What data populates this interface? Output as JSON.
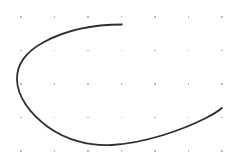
{
  "canvas": {
    "width": 239,
    "height": 168,
    "background_color": "#ffffff",
    "title": "C-Curve Sketch"
  },
  "grid": {
    "name": "dot-grid",
    "visible": true,
    "columns": 7,
    "rows": 5,
    "origin_x": 21,
    "origin_y": 17,
    "spacing_x": 33.5,
    "spacing_y": 33.5,
    "dot_color": "#b9b9b9",
    "dot_size": 1.2,
    "dot_count": 35,
    "dots": [
      {
        "x": 21,
        "y": 17
      },
      {
        "x": 54.5,
        "y": 17
      },
      {
        "x": 88,
        "y": 17
      },
      {
        "x": 121.5,
        "y": 17
      },
      {
        "x": 155,
        "y": 17
      },
      {
        "x": 188.5,
        "y": 17
      },
      {
        "x": 222,
        "y": 17
      },
      {
        "x": 21,
        "y": 50.5
      },
      {
        "x": 54.5,
        "y": 50.5
      },
      {
        "x": 88,
        "y": 50.5
      },
      {
        "x": 121.5,
        "y": 50.5
      },
      {
        "x": 155,
        "y": 50.5
      },
      {
        "x": 188.5,
        "y": 50.5
      },
      {
        "x": 222,
        "y": 50.5
      },
      {
        "x": 21,
        "y": 84
      },
      {
        "x": 54.5,
        "y": 84
      },
      {
        "x": 88,
        "y": 84
      },
      {
        "x": 121.5,
        "y": 84
      },
      {
        "x": 155,
        "y": 84
      },
      {
        "x": 188.5,
        "y": 84
      },
      {
        "x": 222,
        "y": 84
      },
      {
        "x": 21,
        "y": 117.5
      },
      {
        "x": 54.5,
        "y": 117.5
      },
      {
        "x": 88,
        "y": 117.5
      },
      {
        "x": 121.5,
        "y": 117.5
      },
      {
        "x": 155,
        "y": 117.5
      },
      {
        "x": 188.5,
        "y": 117.5
      },
      {
        "x": 222,
        "y": 117.5
      },
      {
        "x": 21,
        "y": 151
      },
      {
        "x": 54.5,
        "y": 151
      },
      {
        "x": 88,
        "y": 151
      },
      {
        "x": 121.5,
        "y": 151
      },
      {
        "x": 155,
        "y": 151
      },
      {
        "x": 188.5,
        "y": 151
      },
      {
        "x": 222,
        "y": 151
      }
    ]
  },
  "curve": {
    "name": "c-shaped-arc",
    "shape": "open-ellipse-arc",
    "stroke_color": "#2e2e2e",
    "stroke_width": 1.8,
    "fill": "none",
    "center_x": 120,
    "center_y": 85,
    "radius_x": 103,
    "radius_y": 60,
    "start_point": {
      "x": 122,
      "y": 24.5
    },
    "end_point": {
      "x": 222.5,
      "y": 107.5
    },
    "gap_side": "right",
    "sweep_direction": "counterclockwise",
    "path_d": "M 122.5 24.5 C 95 24.5 66 30 44 42 C 24.5 52.5 16.5 66 17 80 C 17.5 96 29 113 48 127 C 66 140 90 146.5 112 145 C 146 142.8 182 130 205 118.5 C 212 115 218 111.5 222.5 107.5"
  },
  "meta": {
    "element_count": 36,
    "stroke_style": "solid"
  }
}
